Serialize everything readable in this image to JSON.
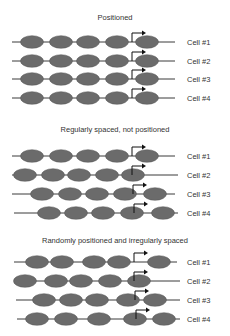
{
  "diagram": {
    "colors": {
      "nucleosome": "#6b6b6b",
      "strand": "#3a3a3a",
      "arrow": "#111111",
      "text": "#333333"
    },
    "panels": [
      {
        "title": "Positioned",
        "title_y": 20,
        "rows": [
          {
            "label": "Cell #1",
            "y": 42,
            "line": [
              12,
              175
            ],
            "nucleosomes": [
              32,
              61,
              88,
              117,
              147
            ],
            "tss_x": 132
          },
          {
            "label": "Cell #2",
            "y": 61,
            "line": [
              12,
              175
            ],
            "nucleosomes": [
              32,
              61,
              88,
              117,
              147
            ],
            "tss_x": 132
          },
          {
            "label": "Cell #3",
            "y": 79,
            "line": [
              12,
              175
            ],
            "nucleosomes": [
              32,
              61,
              88,
              117,
              147
            ],
            "tss_x": 132
          },
          {
            "label": "Cell #4",
            "y": 98,
            "line": [
              12,
              175
            ],
            "nucleosomes": [
              32,
              61,
              88,
              117,
              147
            ],
            "tss_x": 132
          }
        ]
      },
      {
        "title": "Regularly spaced, not positioned",
        "title_y": 132,
        "rows": [
          {
            "label": "Cell #1",
            "y": 156,
            "line": [
              12,
              175
            ],
            "nucleosomes": [
              32,
              61,
              88,
              117,
              147
            ],
            "tss_x": 132
          },
          {
            "label": "Cell #2",
            "y": 175,
            "line": [
              12,
              178
            ],
            "nucleosomes": [
              25,
              53,
              79,
              107,
              133
            ],
            "tss_x": 132
          },
          {
            "label": "Cell #3",
            "y": 194,
            "line": [
              12,
              175
            ],
            "nucleosomes": [
              42,
              70,
              97,
              125,
              155
            ],
            "tss_x": 133
          },
          {
            "label": "Cell #4",
            "y": 213,
            "line": [
              14,
              178
            ],
            "nucleosomes": [
              49,
              76,
              103,
              132,
              163
            ],
            "tss_x": 134
          }
        ]
      },
      {
        "title": "Randomly positioned and irregularly spaced",
        "title_y": 243,
        "rows": [
          {
            "label": "Cell #1",
            "y": 262,
            "line": [
              14,
              177
            ],
            "nucleosomes": [
              37,
              62,
              94,
              119,
              159
            ],
            "tss_x": 134
          },
          {
            "label": "Cell #2",
            "y": 281,
            "line": [
              15,
              180
            ],
            "nucleosomes": [
              25,
              56,
              81,
              110,
              139
            ],
            "tss_x": 134
          },
          {
            "label": "Cell #3",
            "y": 300,
            "line": [
              16,
              180
            ],
            "nucleosomes": [
              44,
              71,
              97,
              128,
              155
            ],
            "tss_x": 135
          },
          {
            "label": "Cell #4",
            "y": 319,
            "line": [
              17,
              180
            ],
            "nucleosomes": [
              37,
              66,
              99,
              135,
              164
            ],
            "tss_x": 136
          }
        ]
      }
    ]
  }
}
